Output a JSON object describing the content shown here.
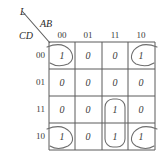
{
  "diagram": {
    "type": "karnaugh-map",
    "output_label": "L",
    "column_variable_label": "AB",
    "row_variable_label": "CD",
    "column_headers": [
      "00",
      "01",
      "11",
      "10"
    ],
    "row_headers": [
      "00",
      "01",
      "11",
      "10"
    ],
    "cells": [
      {
        "row": "00",
        "col": "00",
        "value": "1"
      },
      {
        "row": "00",
        "col": "01",
        "value": "0"
      },
      {
        "row": "00",
        "col": "11",
        "value": "0"
      },
      {
        "row": "00",
        "col": "10",
        "value": "1"
      },
      {
        "row": "01",
        "col": "00",
        "value": "0"
      },
      {
        "row": "01",
        "col": "01",
        "value": "0"
      },
      {
        "row": "01",
        "col": "11",
        "value": "0"
      },
      {
        "row": "01",
        "col": "10",
        "value": "0"
      },
      {
        "row": "11",
        "col": "00",
        "value": "0"
      },
      {
        "row": "11",
        "col": "01",
        "value": "0"
      },
      {
        "row": "11",
        "col": "11",
        "value": "1"
      },
      {
        "row": "11",
        "col": "10",
        "value": "0"
      },
      {
        "row": "10",
        "col": "00",
        "value": "1"
      },
      {
        "row": "10",
        "col": "01",
        "value": "0"
      },
      {
        "row": "10",
        "col": "11",
        "value": "1"
      },
      {
        "row": "10",
        "col": "10",
        "value": "1"
      }
    ],
    "groupings": [
      {
        "name": "corner-wrap-group",
        "shape": "four-corner-arcs",
        "cells": [
          "00/00",
          "00/10",
          "10/00",
          "10/10"
        ]
      },
      {
        "name": "vertical-pair-group",
        "shape": "rounded-rectangle",
        "cells": [
          "11/11",
          "10/11"
        ]
      }
    ],
    "colors": {
      "grid_line": "#5a5a5a",
      "group_outline": "#6e6e6e",
      "text": "#3a3a3a"
    }
  }
}
